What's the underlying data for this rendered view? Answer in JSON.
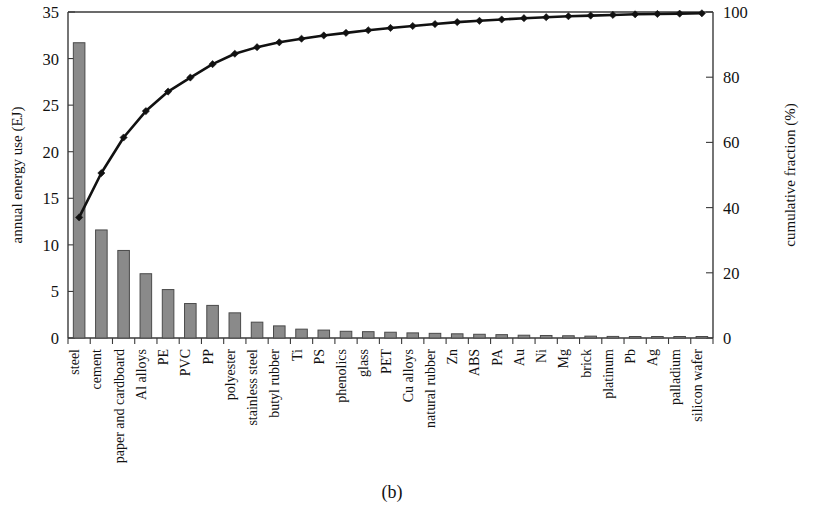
{
  "figure": {
    "caption": "(b)",
    "left_axis_title": "annual energy use (EJ)",
    "right_axis_title": "cumulative fraction (%)",
    "bar_color": "#8a8a8a",
    "bar_edge_color": "#4a4a4a",
    "line_color": "#111111",
    "background": "#ffffff"
  },
  "chart_data": {
    "type": "bar",
    "title": "",
    "subtitle": "",
    "xlabel": "",
    "ylabel": "annual energy use (EJ)",
    "y2label": "cumulative fraction (%)",
    "ylim": [
      0,
      35
    ],
    "y2lim": [
      0,
      100
    ],
    "yticks": [
      0,
      5,
      10,
      15,
      20,
      25,
      30,
      35
    ],
    "y2ticks": [
      0,
      20,
      40,
      60,
      80,
      100
    ],
    "grid": false,
    "legend": null,
    "categories": [
      "steel",
      "cement",
      "paper and cardboard",
      "Al alloys",
      "PE",
      "PVC",
      "PP",
      "polyester",
      "stainless steel",
      "butyl rubber",
      "Ti",
      "PS",
      "phenolics",
      "glass",
      "PET",
      "Cu alloys",
      "natural rubber",
      "Zn",
      "ABS",
      "PA",
      "Au",
      "Ni",
      "Mg",
      "brick",
      "platinum",
      "Pb",
      "Ag",
      "palladium",
      "silicon wafer"
    ],
    "series": [
      {
        "name": "annual energy use (EJ)",
        "axis": "left",
        "units": "EJ",
        "render": "bar",
        "values": [
          31.7,
          11.6,
          9.4,
          6.9,
          5.2,
          3.7,
          3.5,
          2.7,
          1.7,
          1.3,
          0.95,
          0.85,
          0.72,
          0.68,
          0.62,
          0.55,
          0.5,
          0.45,
          0.4,
          0.36,
          0.3,
          0.27,
          0.24,
          0.2,
          0.17,
          0.14,
          0.1,
          0.07,
          0.05
        ]
      },
      {
        "name": "cumulative fraction (%)",
        "axis": "right",
        "units": "%",
        "render": "line",
        "marker": "diamond",
        "values": [
          37.0,
          50.6,
          61.5,
          69.6,
          75.6,
          79.9,
          84.0,
          87.2,
          89.2,
          90.7,
          91.8,
          92.8,
          93.6,
          94.4,
          95.1,
          95.7,
          96.3,
          96.9,
          97.3,
          97.7,
          98.1,
          98.4,
          98.7,
          98.9,
          99.1,
          99.3,
          99.4,
          99.5,
          99.6
        ]
      }
    ]
  }
}
